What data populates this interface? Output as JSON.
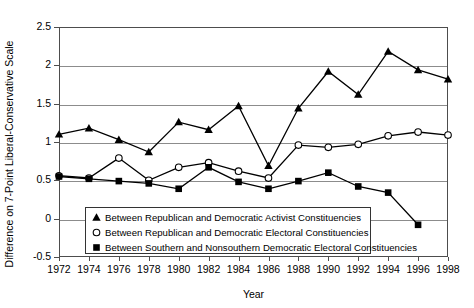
{
  "chart_data": {
    "type": "line",
    "title": "",
    "xlabel": "Year",
    "ylabel": "Difference on 7-Point Liberal-Conservative Scale",
    "x": [
      1972,
      1974,
      1976,
      1978,
      1980,
      1982,
      1984,
      1986,
      1988,
      1990,
      1992,
      1994,
      1996,
      1998
    ],
    "xtick_labels": [
      "1972",
      "1974",
      "1976",
      "1978",
      "1980",
      "1982",
      "1984",
      "1986",
      "1988",
      "1990",
      "1992",
      "1994",
      "1996",
      "1998"
    ],
    "ytick_labels": [
      "2.5",
      "2",
      "1.5",
      "1",
      "0.5",
      "0",
      "-0.5"
    ],
    "ytick_values": [
      2.5,
      2,
      1.5,
      1,
      0.5,
      0,
      -0.5
    ],
    "ylim": [
      -0.5,
      2.5
    ],
    "xlim": [
      1972,
      1998
    ],
    "grid": "horizontal",
    "legend_position": "inside-bottom-center",
    "series": [
      {
        "name": "Between Republican and Democratic Activist Constituencies",
        "marker": "filled-triangle",
        "values": [
          1.1,
          1.18,
          1.03,
          0.87,
          1.26,
          1.16,
          1.47,
          0.69,
          1.44,
          1.92,
          1.62,
          2.18,
          1.94,
          1.82
        ]
      },
      {
        "name": "Between Republican and Democratic Electoral Constituencies",
        "marker": "open-circle",
        "values": [
          0.56,
          0.53,
          0.79,
          0.5,
          0.67,
          0.73,
          0.62,
          0.53,
          0.96,
          0.93,
          0.97,
          1.08,
          1.13,
          1.09
        ]
      },
      {
        "name": "Between Southern and Nonsouthern Democratic Electoral Constituencies",
        "marker": "filled-square",
        "values": [
          0.55,
          0.52,
          0.49,
          0.46,
          0.39,
          0.67,
          0.48,
          0.39,
          0.49,
          0.6,
          0.42,
          0.34,
          -0.08,
          null
        ]
      }
    ]
  },
  "legend": {
    "items": [
      {
        "marker": "filled-triangle",
        "label": "Between Republican and Democratic Activist Constituencies"
      },
      {
        "marker": "open-circle",
        "label": "Between Republican and Democratic Electoral Constituencies"
      },
      {
        "marker": "filled-square",
        "label": "Between Southern and Nonsouthern Democratic Electoral Constituencies"
      }
    ]
  },
  "colors": {
    "line": "#000000",
    "grid": "#8c8c8c",
    "axis": "#4d4d4d",
    "background": "#ffffff"
  }
}
